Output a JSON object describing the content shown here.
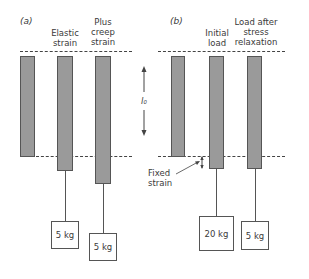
{
  "panel_a": {
    "label": "(a)",
    "columns": [
      {
        "title": "",
        "weight": ""
      },
      {
        "title_line1": "Elastic",
        "title_line2": "strain",
        "weight": "5 kg"
      },
      {
        "title_line1": "Plus",
        "title_line2": "creep",
        "title_line3": "strain",
        "weight": "5 kg"
      }
    ]
  },
  "panel_b": {
    "label": "(b)",
    "columns": [
      {
        "title": "",
        "weight": ""
      },
      {
        "title_line1": "Initial",
        "title_line2": "load",
        "weight": "20 kg"
      },
      {
        "title_line1": "Load after",
        "title_line2": "stress",
        "title_line3": "relaxation",
        "weight": "5 kg"
      }
    ],
    "annotation_line1": "Fixed",
    "annotation_line2": "strain"
  },
  "length_label": "l₀",
  "colors": {
    "bar_fill": "#9a9a9a",
    "outline": "#555555",
    "background": "#ffffff"
  }
}
